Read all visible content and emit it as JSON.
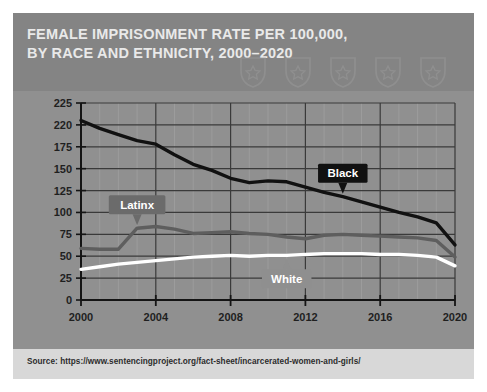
{
  "header": {
    "title": "FEMALE IMPRISONMENT RATE PER 100,000, BY RACE AND ETHNICITY, 2000–2020",
    "badge_count": 5,
    "badge_icon": "police-badge-icon",
    "background": "#848484",
    "title_color": "#e9e9e9"
  },
  "footer": {
    "source": "Source: https://www.sentencingproject.org/fact-sheet/incarcerated-women-and-girls/",
    "background": "#d8d8d8",
    "text_color": "#2c2c2c"
  },
  "card": {
    "background": "#8a8a8a",
    "plot_background": "#909090"
  },
  "chart_data": {
    "type": "line",
    "title": "FEMALE IMPRISONMENT RATE PER 100,000, BY RACE AND ETHNICITY, 2000–2020",
    "xlabel": "",
    "ylabel": "",
    "xlim": [
      2000,
      2020
    ],
    "ylim": [
      0,
      225
    ],
    "grid": true,
    "legend": "inline-callouts",
    "ytick_labels": [
      "0",
      "25",
      "50",
      "75",
      "100",
      "125",
      "150",
      "175",
      "220",
      "225"
    ],
    "ytick_values": [
      0,
      25,
      50,
      75,
      100,
      125,
      150,
      175,
      200,
      225
    ],
    "xtick_labels": [
      "2000",
      "2004",
      "2008",
      "2012",
      "2016",
      "2020"
    ],
    "xtick_values": [
      2000,
      2004,
      2008,
      2012,
      2016,
      2020
    ],
    "x": [
      2000,
      2001,
      2002,
      2003,
      2004,
      2005,
      2006,
      2007,
      2008,
      2009,
      2010,
      2011,
      2012,
      2013,
      2014,
      2015,
      2016,
      2017,
      2018,
      2019,
      2020
    ],
    "series": [
      {
        "name": "Black",
        "color": "#111111",
        "label_text_color": "#ffffff",
        "label_bg": "#111111",
        "label_at_year": 2014,
        "values": [
          205,
          196,
          189,
          182,
          178,
          166,
          155,
          148,
          139,
          134,
          136,
          135,
          129,
          123,
          118,
          112,
          106,
          100,
          95,
          88,
          63
        ]
      },
      {
        "name": "Latinx",
        "color": "#5e5e5e",
        "label_text_color": "#ffffff",
        "label_bg": "#6b6b6b",
        "label_at_year": 2003,
        "values": [
          59,
          58,
          58,
          82,
          84,
          81,
          76,
          77,
          78,
          76,
          75,
          72,
          70,
          74,
          75,
          74,
          73,
          72,
          71,
          68,
          49
        ]
      },
      {
        "name": "White",
        "color": "#ffffff",
        "label_text_color": "#ffffff",
        "label_bg": "#8f8f8f",
        "label_at_year": 2011,
        "values": [
          35,
          38,
          41,
          43,
          45,
          47,
          49,
          50,
          51,
          50,
          51,
          51,
          52,
          53,
          53,
          53,
          52,
          52,
          51,
          49,
          39
        ]
      }
    ]
  }
}
